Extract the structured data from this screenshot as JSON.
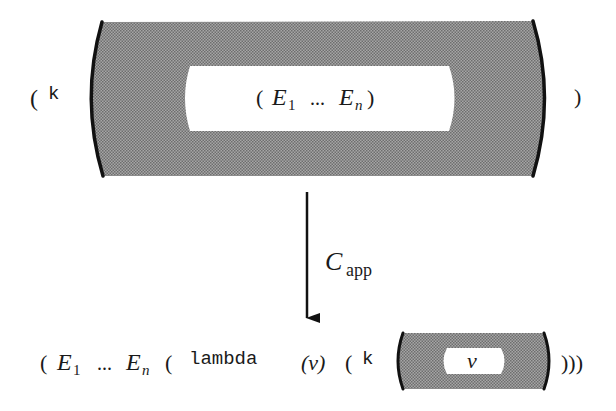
{
  "diagram": {
    "type": "cps-transformation",
    "colors": {
      "context_fill": "#8c8c8c",
      "context_fill_light": "#b4b4b4",
      "hole_fill": "#ffffff",
      "stroke": "#111111",
      "text": "#1a1a1a"
    },
    "top_expression": {
      "open_paren": "(",
      "continuation": "k",
      "hole": {
        "open_paren": "(",
        "first_var": "E",
        "first_sub": "1",
        "ellipsis": "...",
        "last_var": "E",
        "last_sub": "n",
        "close_paren": ")"
      },
      "close_paren": ")"
    },
    "arrow": {
      "label_main": "C",
      "label_sub": "app"
    },
    "bottom_expression": {
      "open_paren": "(",
      "first_var": "E",
      "first_sub": "1",
      "ellipsis": "...",
      "last_var": "E",
      "last_sub": "n",
      "lambda_open": "(",
      "lambda_keyword": "lambda",
      "params": "(v)",
      "body_open": "(",
      "continuation": "k",
      "hole_value": "v",
      "close_parens": ")))"
    }
  }
}
